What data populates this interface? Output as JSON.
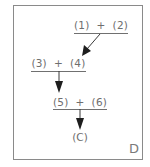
{
  "diagram": {
    "panel_label": "D",
    "steps": [
      {
        "expression": "(1)  +  (2)"
      },
      {
        "expression": "(3)  +  (4)"
      },
      {
        "expression": "(5)  +  (6)"
      }
    ],
    "result": "(C)"
  },
  "colors": {
    "frame": "#8a8a8a",
    "text": "#6e6e6e",
    "arrow": "#2a2a2a"
  }
}
